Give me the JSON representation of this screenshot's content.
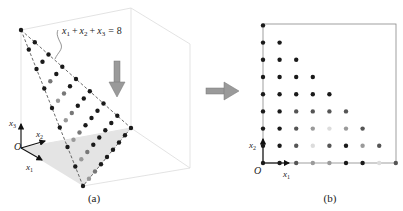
{
  "panel_a": {
    "caption": "(a)",
    "equation": {
      "x1": "x",
      "s1": "1",
      "x2": "x",
      "s2": "2",
      "x3": "x",
      "s3": "3",
      "rhs": "8",
      "plus": "+",
      "eq": "="
    },
    "axes": {
      "origin": "O",
      "x1": "x",
      "x1_sub": "1",
      "x2": "x",
      "x2_sub": "2",
      "x3": "x",
      "x3_sub": "3"
    },
    "arrow_icon": "down-arrow"
  },
  "transition_arrow_icon": "right-arrow",
  "panel_b": {
    "caption": "(b)",
    "axes": {
      "origin": "O",
      "x1": "x",
      "x1_sub": "1",
      "x2": "x",
      "x2_sub": "2"
    },
    "grid_max": 8,
    "colors": {
      "dark": "#1a1a1a",
      "mid": "#555555",
      "light": "#9a9a9a",
      "faint": "#dcdcdc"
    },
    "points_rows_bottom_up": [
      [
        "dark",
        "dark",
        "mid",
        "light",
        "light",
        "dark",
        "dark",
        "faint",
        "mid"
      ],
      [
        "dark",
        "dark",
        "mid",
        "faint",
        "mid",
        "dark",
        "light",
        "mid"
      ],
      [
        "dark",
        "dark",
        "mid",
        "light",
        "faint",
        "light",
        "mid"
      ],
      [
        "dark",
        "dark",
        "mid",
        "mid",
        "mid",
        "mid"
      ],
      [
        "dark",
        "dark",
        "dark",
        "dark",
        "dark"
      ],
      [
        "dark",
        "dark",
        "dark",
        "dark"
      ],
      [
        "dark",
        "dark",
        "dark"
      ],
      [
        "dark",
        "dark"
      ],
      [
        "dark"
      ]
    ]
  }
}
